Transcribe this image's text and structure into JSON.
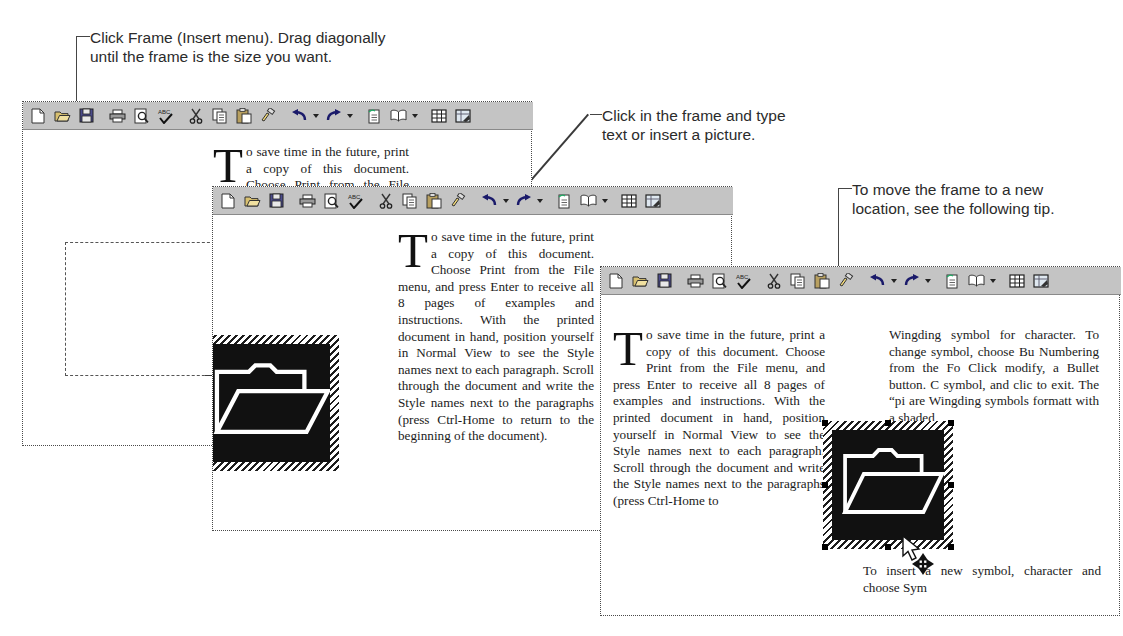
{
  "figure": {
    "background_color": "#ffffff",
    "ink_color": "#2b2b2b"
  },
  "callouts": [
    {
      "id": "callout-insert-frame",
      "text": "Click Frame (Insert menu). Drag diagonally\nuntil the frame is the size you want."
    },
    {
      "id": "callout-type-text",
      "text": "Click in the frame and type\ntext or insert a picture."
    },
    {
      "id": "callout-move-frame",
      "text": "To move the frame to a new\nlocation, see the following tip."
    }
  ],
  "toolbar": {
    "background_color": "#c4c4c4",
    "buttons": [
      {
        "name": "new-document",
        "label": "New"
      },
      {
        "name": "open-document",
        "label": "Open"
      },
      {
        "name": "save-document",
        "label": "Save"
      },
      {
        "name": "print",
        "label": "Print"
      },
      {
        "name": "print-preview",
        "label": "Print Preview"
      },
      {
        "name": "spelling-check",
        "label": "Spelling",
        "glyph": "ABC"
      },
      {
        "name": "cut",
        "label": "Cut"
      },
      {
        "name": "copy",
        "label": "Copy"
      },
      {
        "name": "paste",
        "label": "Paste"
      },
      {
        "name": "format-painter",
        "label": "Format Painter"
      },
      {
        "name": "undo",
        "label": "Undo",
        "dropdown": true
      },
      {
        "name": "redo",
        "label": "Redo",
        "dropdown": true
      },
      {
        "name": "insert-hyperlink",
        "label": "Insert Hyperlink"
      },
      {
        "name": "web-toolbar",
        "label": "Web Toolbar",
        "dropdown": true
      },
      {
        "name": "tables-and-borders",
        "label": "Tables and Borders"
      },
      {
        "name": "insert-table",
        "label": "Insert Table"
      }
    ]
  },
  "windows": [
    {
      "id": "window-1",
      "stage": "drag-frame",
      "dropcap": "T",
      "body": "o save time in the future, print a copy of this document. Choose Print from the File menu, and press Enter to receive all 8 pages of examples and instructions. With the printed document in hand, position yourself in Normal View to see the Style names next to each paragraph. Scroll through the document and write the Style names next to the paragraphs (press Ctrl-Home to return to the beginning of the document).",
      "frame": {
        "state": "being-drawn",
        "style": "dashed"
      },
      "cursor": "crosshair"
    },
    {
      "id": "window-2",
      "stage": "frame-filled",
      "dropcap": "T",
      "body": "o save time in the future, print a copy of this document. Choose Print from the File menu, and press Enter to receive all 8 pages of examples and instructions. With the printed document in hand, position yourself in Normal View to see the Style names next to each paragraph. Scroll through the document and write the Style names next to the paragraphs (press Ctrl-Home to return to the beginning of the document).",
      "graphic": {
        "name": "folder-graphic",
        "alt": "open folder clip art",
        "selected": true
      }
    },
    {
      "id": "window-3",
      "stage": "move-frame",
      "dropcap": "T",
      "column_left": "o save time in the future, print a copy of this document. Choose Print from the File menu, and press Enter to receive all 8 pages of examples and instructions. With the printed document in hand, position yourself in Normal View to see the Style names next to each paragraph. Scroll through the document and write the Style names next to the paragraphs (press Ctrl-Home to",
      "column_right_top": "Wingding symbol for character. To change symbol, choose Bu Numbering from the Fo Click modify, a Bullet button. C symbol, and clic to exit. The “pi are Wingding symbols formatt with a shaded",
      "column_right_bottom": "To insert a new symbol, character and choose Sym",
      "graphic": {
        "name": "folder-graphic",
        "alt": "open folder clip art",
        "selected": true
      },
      "cursor": "move"
    }
  ]
}
